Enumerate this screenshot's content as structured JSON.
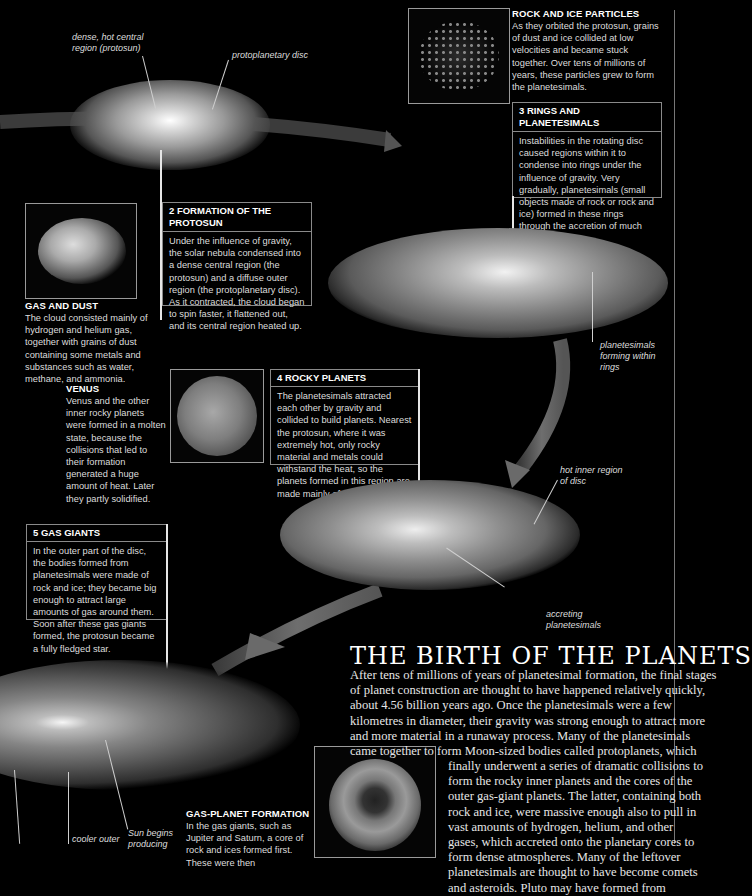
{
  "page_title": "THE BIRTH OF THE PLANETS",
  "intro": {
    "lines_full": [
      "After tens of millions of years of planetesimal formation, the final stages",
      "of planet construction are thought to have happened relatively quickly,",
      "about 4.56 billion years ago. Once the planetesimals were a few",
      "kilometres in diameter, their gravity was strong enough to attract more",
      "and more material in a runaway process. Many of the planetesimals",
      "came together to form Moon-sized bodies called protoplanets, which"
    ],
    "lines_indented": [
      "finally underwent a series of dramatic collisions to",
      "form the rocky inner planets and the cores of the",
      "outer gas-giant planets. The latter, containing both",
      "rock and ice, were massive enough also to pull in",
      "vast amounts of hydrogen, helium, and other",
      "gases, which accreted onto the planetary cores to",
      "form dense atmospheres. Many of the leftover",
      "planetesimals are thought to have become comets",
      "and asteroids. Pluto may have formed from"
    ]
  },
  "labels": {
    "dense_core": [
      "dense, hot central",
      "region (protosun)"
    ],
    "protoplanetary_disc": "protoplanetary disc",
    "planetesimals_rings": [
      "planetesimals",
      "forming within",
      "rings"
    ],
    "hot_inner": [
      "hot inner region",
      "of disc"
    ],
    "accreting": [
      "accreting",
      "planetesimals"
    ],
    "cooler_outer": "cooler outer",
    "sun_begins": [
      "Sun begins",
      "producing"
    ]
  },
  "captions": {
    "rock_ice": {
      "title": "ROCK AND ICE PARTICLES",
      "body": "As they orbited the protosun, grains of dust and ice collided at low velocities and became stuck together. Over tens of millions of years, these particles grew to form the planetesimals."
    },
    "gas_dust": {
      "title": "GAS AND DUST",
      "body": "The cloud consisted mainly of hydrogen and helium gas, together with grains of dust containing some metals and substances such as water, methane, and ammonia."
    },
    "venus": {
      "title": "VENUS",
      "body": "Venus and the other inner rocky planets were formed in a molten state, because the collisions that led to their formation generated a huge amount of heat. Later they partly solidified."
    },
    "gas_planet": {
      "title": "GAS-PLANET FORMATION",
      "body": "In the gas giants, such as Jupiter and Saturn, a core of rock and ices formed first. These were then"
    }
  },
  "steps": [
    {
      "title": "2 FORMATION OF THE PROTOSUN",
      "body": "Under the influence of gravity, the solar nebula condensed into a dense central region (the protosun) and a diffuse outer region (the protoplanetary disc). As it contracted, the cloud began to spin faster, it flattened out, and its central region heated up."
    },
    {
      "title": "3 RINGS AND PLANETESIMALS",
      "body": "Instabilities in the rotating disc caused regions within it to condense into rings under the influence of gravity. Very gradually, planetesimals (small objects made of rock or rock and ice) formed in these rings through the accretion of much smaller particles."
    },
    {
      "title": "4 ROCKY PLANETS",
      "body": "The planetesimals attracted each other by gravity and collided to build planets. Nearest the protosun, where it was extremely hot, only rocky material and metals could withstand the heat, so the planets formed in this region are made mainly of these materials."
    },
    {
      "title": "5 GAS GIANTS",
      "body": "In the outer part of the disc, the bodies formed from planetesimals were made of rock and ice; they became big enough to attract large amounts of gas around them. Soon after these gas giants formed, the protosun became a fully fledged star."
    }
  ],
  "colors": {
    "background": "#000000",
    "text": "#e8e8e8",
    "box_border": "#8a8a8a",
    "arrow": "#6a6a6a"
  }
}
